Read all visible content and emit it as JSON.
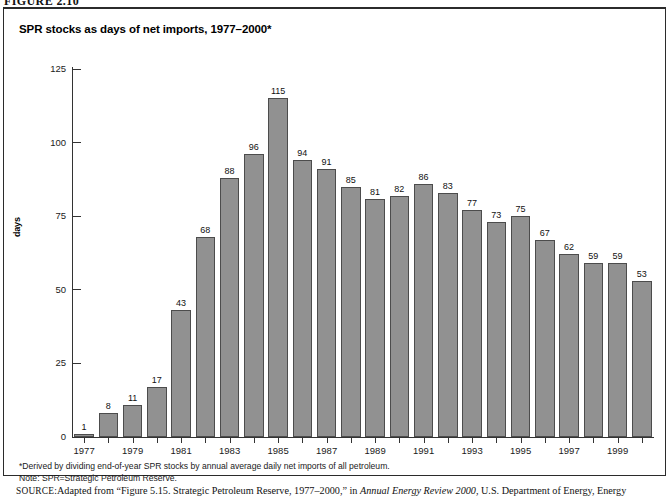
{
  "figure": {
    "label": "FIGURE 2.10"
  },
  "chart_title": "SPR stocks as days of net imports, 1977–2000*",
  "footnotes": [
    "*Derived by dividing end-of-year SPR stocks by annual average daily net imports of all petroleum.",
    "Note: SPR=Strategic Petroleum Reserve."
  ],
  "source": {
    "label": "SOURCE:",
    "text_before_italic": "Adapted from “Figure 5.15. Strategic Petroleum Reserve, 1977–2000,” in ",
    "italic_title": "Annual Energy Review 2000",
    "text_after_italic": ", U.S. Department of Energy, Energy"
  },
  "colors": {
    "bar_fill": "#919191",
    "bar_stroke": "#4c4c4c",
    "axis": "#333333",
    "text": "#111111",
    "frame": "#2b2b2b"
  },
  "chart_data": {
    "type": "bar",
    "title": "SPR stocks as days of net imports, 1977–2000*",
    "xlabel": "",
    "ylabel": "days",
    "ylim": [
      0,
      125
    ],
    "yticks": [
      0,
      25,
      50,
      75,
      100,
      125
    ],
    "grid": false,
    "legend": false,
    "categories": [
      "1977",
      "1978",
      "1979",
      "1980",
      "1981",
      "1982",
      "1983",
      "1984",
      "1985",
      "1986",
      "1987",
      "1988",
      "1989",
      "1990",
      "1991",
      "1992",
      "1993",
      "1994",
      "1995",
      "1996",
      "1997",
      "1998",
      "1999",
      "2000"
    ],
    "xtick_labels": [
      "1977",
      "1979",
      "1981",
      "1983",
      "1985",
      "1987",
      "1989",
      "1991",
      "1993",
      "1995",
      "1997",
      "1999"
    ],
    "values": [
      1,
      8,
      11,
      17,
      43,
      68,
      88,
      96,
      115,
      94,
      91,
      85,
      81,
      82,
      86,
      83,
      77,
      73,
      75,
      67,
      62,
      59,
      59,
      53
    ],
    "value_labels": [
      "1",
      "8",
      "11",
      "17",
      "43",
      "68",
      "88",
      "96",
      "115",
      "94",
      "91",
      "85",
      "81",
      "82",
      "86",
      "83",
      "77",
      "73",
      "75",
      "67",
      "62",
      "59",
      "59",
      "53"
    ]
  }
}
